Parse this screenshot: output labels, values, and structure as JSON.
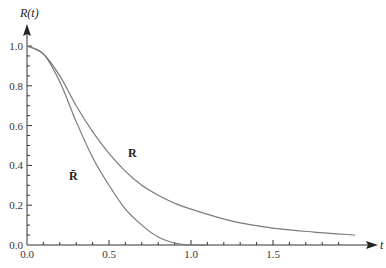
{
  "chart_data": {
    "type": "line",
    "title": "",
    "xlabel": "t",
    "ylabel": "R(t)",
    "xlim": [
      0,
      2.1
    ],
    "ylim": [
      0,
      1.05
    ],
    "grid": false,
    "legend": "inline labels",
    "x_ticks": [
      "0.0",
      "0.5",
      "1.0",
      "1.5"
    ],
    "y_ticks": [
      "0.0",
      "0.2",
      "0.4",
      "0.6",
      "0.8",
      "1.0"
    ],
    "series": [
      {
        "name": "R",
        "label": "R",
        "color": "#7a7a7a",
        "x": [
          0,
          0.1,
          0.2,
          0.3,
          0.4,
          0.5,
          0.6,
          0.7,
          0.8,
          0.9,
          1.0,
          1.25,
          1.5,
          1.75,
          2.0
        ],
        "values": [
          1.0,
          0.96,
          0.85,
          0.7,
          0.57,
          0.46,
          0.37,
          0.3,
          0.25,
          0.21,
          0.18,
          0.12,
          0.085,
          0.065,
          0.05
        ]
      },
      {
        "name": "R-bar",
        "label": "R̄",
        "color": "#7a7a7a",
        "x": [
          0,
          0.1,
          0.2,
          0.3,
          0.4,
          0.5,
          0.6,
          0.7,
          0.8,
          0.9,
          1.0,
          1.1
        ],
        "values": [
          1.0,
          0.96,
          0.82,
          0.62,
          0.44,
          0.3,
          0.18,
          0.1,
          0.04,
          0.01,
          0.0,
          0.0
        ]
      }
    ],
    "annotations": [
      {
        "text": "R",
        "x": 0.65,
        "y": 0.46
      },
      {
        "text": "R̄",
        "x": 0.28,
        "y": 0.35
      }
    ]
  }
}
